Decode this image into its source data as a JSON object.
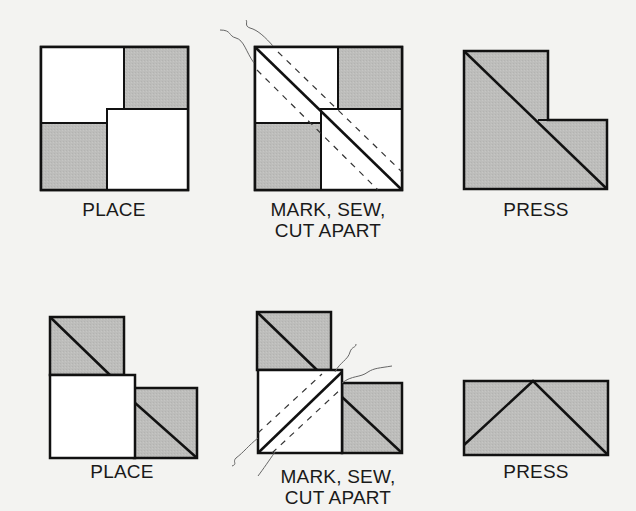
{
  "colors": {
    "background": "#f3f3f1",
    "fabric_gray": "#bdbdbb",
    "fabric_white": "#ffffff",
    "outline": "#111111",
    "thread": "#555555"
  },
  "rows": [
    {
      "steps": [
        {
          "id": "row1-place",
          "label": "PLACE"
        },
        {
          "id": "row1-mark",
          "label": "MARK, SEW,\nCUT APART"
        },
        {
          "id": "row1-press",
          "label": "PRESS"
        }
      ]
    },
    {
      "steps": [
        {
          "id": "row2-place",
          "label": "PLACE"
        },
        {
          "id": "row2-mark",
          "label": "MARK, SEW,\nCUT APART"
        },
        {
          "id": "row2-press",
          "label": "PRESS"
        }
      ]
    }
  ]
}
